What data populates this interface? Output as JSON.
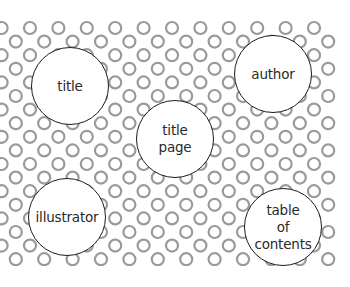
{
  "diagram": {
    "type": "word-bubbles",
    "background_pattern": {
      "shape": "ring",
      "ring_color": "#9a9a9a",
      "area": {
        "x_min": 0,
        "x_max": 336,
        "y_min": 20,
        "y_max": 266
      },
      "spacing_x": 28.4,
      "spacing_y": 13.6,
      "ring_radius": 6
    },
    "bubbles": [
      {
        "id": "title",
        "label": "title",
        "cx": 71,
        "cy": 87
      },
      {
        "id": "author",
        "label": "author",
        "cx": 274,
        "cy": 75
      },
      {
        "id": "title-page",
        "label": "title\npage",
        "cx": 176,
        "cy": 140
      },
      {
        "id": "illustrator",
        "label": "illustrator",
        "cx": 68,
        "cy": 218
      },
      {
        "id": "table-of-contents",
        "label": "table\nof\ncontents",
        "cx": 284,
        "cy": 228
      }
    ],
    "bubble_radius": 39,
    "bubble_border_color": "#1c1c1c"
  }
}
